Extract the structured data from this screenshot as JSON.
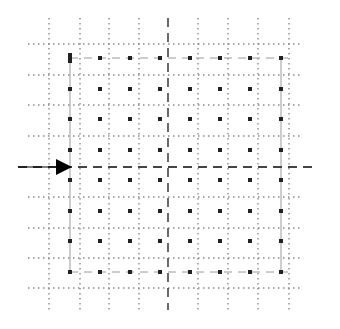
{
  "diagram": {
    "colors": {
      "background": "#ffffff",
      "grid": "#8a8a8a",
      "cross": "#444444",
      "dots": "#222222",
      "arrow": "#000000",
      "frame": "#9a9a9a"
    },
    "grid": {
      "vertical_x": [
        49,
        80,
        109,
        139,
        198,
        228,
        258,
        289
      ],
      "horizontal_y": [
        44,
        75,
        105,
        136,
        197,
        228,
        258,
        288
      ],
      "extent": {
        "x0": 28,
        "x1": 300,
        "y0": 18,
        "y1": 310
      }
    },
    "cross": {
      "vertical_x": 168,
      "horizontal_y": 167,
      "extent": {
        "x0": 18,
        "x1": 316,
        "y0": 18,
        "y1": 310
      }
    },
    "arrow": {
      "tail_x": 18,
      "tip_x": 72,
      "y": 167,
      "head_size": 16
    },
    "lattice": {
      "x": [
        70,
        100,
        130,
        160,
        190,
        220,
        250,
        281
      ],
      "y": [
        58,
        89,
        119,
        150,
        180,
        211,
        241,
        272
      ]
    },
    "frame": {
      "x0": 70,
      "x1": 281,
      "y0": 58,
      "y1": 272
    }
  }
}
